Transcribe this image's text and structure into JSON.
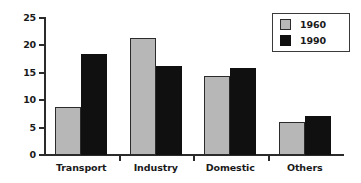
{
  "chart_data": {
    "type": "bar",
    "title": "",
    "subtitle": "",
    "xlabel": "",
    "ylabel": "",
    "categories": [
      "Transport",
      "Industry",
      "Domestic",
      "Others"
    ],
    "series": [
      {
        "name": "1960",
        "color": "#b7b7b7",
        "values": [
          8.7,
          21.3,
          14.5,
          6.1
        ]
      },
      {
        "name": "1990",
        "color": "#101010",
        "values": [
          18.5,
          16.3,
          15.9,
          7.1
        ]
      }
    ],
    "ylim": [
      0,
      25
    ],
    "yticks": [
      0,
      5,
      10,
      15,
      20,
      25
    ],
    "ytick_labels": [
      "0",
      "5",
      "10",
      "15",
      "20",
      "25"
    ],
    "grid": false,
    "legend": {
      "position": "top-right",
      "entries": [
        "1960",
        "1990"
      ]
    },
    "annotations": []
  }
}
